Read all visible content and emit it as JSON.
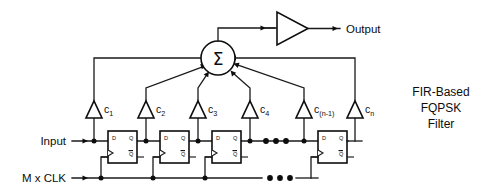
{
  "diagram": {
    "caption": {
      "line1": "FIR-Based",
      "line2": "FQPSK",
      "line3": "Filter"
    },
    "signals": {
      "input_label": "Input",
      "clock_label": "M x CLK",
      "output_label": "Output"
    },
    "summer": {
      "symbol": "Σ",
      "name": "summing-junction"
    },
    "output_amplifier": {
      "name": "output-buffer-amplifier"
    },
    "coefficients": [
      {
        "base": "c",
        "sub": "1"
      },
      {
        "base": "c",
        "sub": "2"
      },
      {
        "base": "c",
        "sub": "3"
      },
      {
        "base": "c",
        "sub": "4"
      },
      {
        "base": "c",
        "sub": "(n-1)"
      },
      {
        "base": "c",
        "sub": "n"
      }
    ],
    "flipflop": {
      "d_label": "D",
      "q_label": "Q",
      "qbar_label": "Q"
    },
    "flipflop_count_shown": 4,
    "ellipsis": "• • •",
    "colors": {
      "background": "#ffffff",
      "ink": "#0d0d0d",
      "wire": "#1a1a1a"
    }
  }
}
